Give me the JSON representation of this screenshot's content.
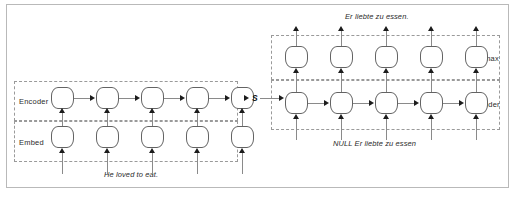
{
  "figure": {
    "background": "#ffffff",
    "border_color": "#b9b9b9",
    "cell_border_color": "#636363",
    "connector_color": "#8a8a8a",
    "arrow_color": "#1c1c1c",
    "dash_color": "#9a9a9a"
  },
  "groups": {
    "encoder": {
      "label": "Encoder"
    },
    "embed": {
      "label": "Embed"
    },
    "softmax": {
      "label": "Softmax"
    },
    "decoder": {
      "label": "Decoder"
    }
  },
  "state": {
    "label": "S"
  },
  "captions": {
    "source_sentence": "He loved to eat.",
    "target_output": "Er liebte zu essen.",
    "decoder_input": "NULL Er liebte zu essen"
  },
  "columns": {
    "encoder_count": 5,
    "decoder_count": 5
  },
  "cells": {
    "encoder": [
      "encoder-cell-1",
      "encoder-cell-2",
      "encoder-cell-3",
      "encoder-cell-4",
      "encoder-cell-5"
    ],
    "embed": [
      "embed-cell-1",
      "embed-cell-2",
      "embed-cell-3",
      "embed-cell-4",
      "embed-cell-5"
    ],
    "softmax": [
      "softmax-cell-1",
      "softmax-cell-2",
      "softmax-cell-3",
      "softmax-cell-4",
      "softmax-cell-5"
    ],
    "decoder": [
      "decoder-cell-1",
      "decoder-cell-2",
      "decoder-cell-3",
      "decoder-cell-4",
      "decoder-cell-5"
    ]
  }
}
